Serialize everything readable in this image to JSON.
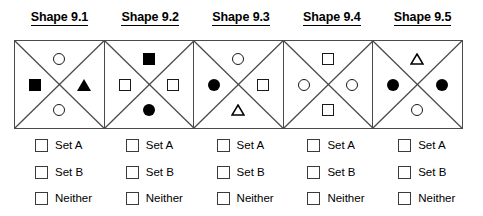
{
  "columns": [
    {
      "header": "Shape 9.1",
      "shapes": {
        "top": "circle-open",
        "left": "square-filled",
        "right": "triangle-filled",
        "bottom": "circle-open"
      },
      "options": [
        {
          "label": "Set A",
          "checked": false
        },
        {
          "label": "Set B",
          "checked": false
        },
        {
          "label": "Neither",
          "checked": false
        }
      ]
    },
    {
      "header": "Shape 9.2",
      "shapes": {
        "top": "square-filled",
        "left": "square-open",
        "right": "square-open",
        "bottom": "circle-filled"
      },
      "options": [
        {
          "label": "Set A",
          "checked": false
        },
        {
          "label": "Set B",
          "checked": false
        },
        {
          "label": "Neither",
          "checked": false
        }
      ]
    },
    {
      "header": "Shape 9.3",
      "shapes": {
        "top": "circle-open",
        "left": "circle-filled",
        "right": "square-open",
        "bottom": "triangle-open"
      },
      "options": [
        {
          "label": "Set A",
          "checked": false
        },
        {
          "label": "Set B",
          "checked": false
        },
        {
          "label": "Neither",
          "checked": false
        }
      ]
    },
    {
      "header": "Shape 9.4",
      "shapes": {
        "top": "square-open",
        "left": "circle-open",
        "right": "circle-open",
        "bottom": "square-open"
      },
      "options": [
        {
          "label": "Set A",
          "checked": false
        },
        {
          "label": "Set B",
          "checked": false
        },
        {
          "label": "Neither",
          "checked": false
        }
      ]
    },
    {
      "header": "Shape 9.5",
      "shapes": {
        "top": "triangle-open",
        "left": "circle-filled",
        "right": "circle-filled",
        "bottom": "circle-open"
      },
      "options": [
        {
          "label": "Set A",
          "checked": false
        },
        {
          "label": "Set B",
          "checked": false
        },
        {
          "label": "Neither",
          "checked": false
        }
      ]
    }
  ],
  "style": {
    "box_border_color": "#4a4a4a",
    "diagonal_color": "#4a4a4a",
    "glyph_color": "#000000",
    "checkbox_border_color": "#3b3b3b",
    "background": "#ffffff"
  }
}
